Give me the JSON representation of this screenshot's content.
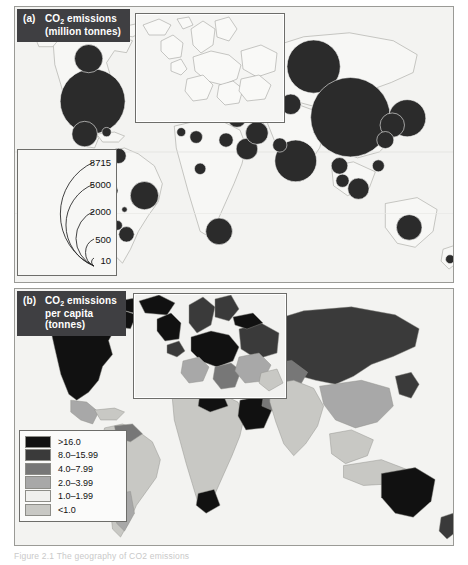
{
  "figure": {
    "caption": "Figure 2.1  The geography of CO2 emissions"
  },
  "colors": {
    "map_background": "#f3f3f1",
    "country_outline": "#8f8f8a",
    "bubble_fill": "#2b2b2b",
    "plate_background": "#3f3f42",
    "plate_text": "#ffffff",
    "class_over16": "#111111",
    "class_8_16": "#3a3a3a",
    "class_4_8": "#777777",
    "class_2_4": "#a8a8a8",
    "class_1_2": "#f0f0ee",
    "class_under1": "#c8c8c4"
  },
  "panel_a": {
    "id": "(a)",
    "title_line1": "CO",
    "title_sub": "2",
    "title_line1_rest": " emissions",
    "title_line2": "(million tonnes)",
    "legend": {
      "name": "bubble-size-legend",
      "unit": "million tonnes",
      "entries": [
        {
          "label": "8715",
          "value": 8715
        },
        {
          "label": "5000",
          "value": 5000
        },
        {
          "label": "2000",
          "value": 2000
        },
        {
          "label": "500",
          "value": 500
        },
        {
          "label": "10",
          "value": 10
        }
      ]
    },
    "inset": {
      "name": "europe-inset",
      "region": "Europe"
    }
  },
  "panel_b": {
    "id": "(b)",
    "title_line1": "CO",
    "title_sub": "2",
    "title_line1_rest": " emissions",
    "title_line2": "per capita",
    "title_line3": "(tonnes)",
    "legend": {
      "name": "per-capita-class-legend",
      "unit": "tonnes",
      "entries": [
        {
          "label": ">16.0",
          "color": "#111111"
        },
        {
          "label": "8.0–15.99",
          "color": "#3a3a3a"
        },
        {
          "label": "4.0–7.99",
          "color": "#777777"
        },
        {
          "label": "2.0–3.99",
          "color": "#a8a8a8"
        },
        {
          "label": "1.0–1.99",
          "color": "#f0f0ee"
        },
        {
          "label": "<1.0",
          "color": "#c8c8c4"
        }
      ]
    },
    "inset": {
      "name": "europe-inset",
      "region": "Europe"
    }
  },
  "chart_data": [
    {
      "type": "bubble-map",
      "title": "CO2 emissions (million tonnes)",
      "panel": "(a)",
      "unit": "million tonnes",
      "size_legend_values": [
        8715,
        5000,
        2000,
        500,
        10
      ],
      "max_value": 8715,
      "points": [
        {
          "name": "United States",
          "value": 5800,
          "x": 78,
          "y": 95
        },
        {
          "name": "Canada",
          "value": 1100,
          "x": 74,
          "y": 52
        },
        {
          "name": "Mexico",
          "value": 900,
          "x": 70,
          "y": 128
        },
        {
          "name": "Cuba",
          "value": 120,
          "x": 92,
          "y": 126
        },
        {
          "name": "Venezuela",
          "value": 320,
          "x": 104,
          "y": 150
        },
        {
          "name": "Colombia",
          "value": 210,
          "x": 94,
          "y": 160
        },
        {
          "name": "Brazil",
          "value": 1100,
          "x": 130,
          "y": 190
        },
        {
          "name": "Peru",
          "value": 110,
          "x": 99,
          "y": 185
        },
        {
          "name": "Chile",
          "value": 130,
          "x": 103,
          "y": 220
        },
        {
          "name": "Argentina",
          "value": 330,
          "x": 112,
          "y": 229
        },
        {
          "name": "Bolivia",
          "value": 40,
          "x": 110,
          "y": 204
        },
        {
          "name": "Morocco",
          "value": 110,
          "x": 167,
          "y": 126
        },
        {
          "name": "Algeria",
          "value": 220,
          "x": 182,
          "y": 131
        },
        {
          "name": "Egypt",
          "value": 280,
          "x": 212,
          "y": 134
        },
        {
          "name": "Nigeria",
          "value": 180,
          "x": 186,
          "y": 163
        },
        {
          "name": "South Africa",
          "value": 980,
          "x": 205,
          "y": 226
        },
        {
          "name": "Saudi Arabia",
          "value": 640,
          "x": 233,
          "y": 143
        },
        {
          "name": "Iran",
          "value": 700,
          "x": 243,
          "y": 127
        },
        {
          "name": "Turkey",
          "value": 460,
          "x": 223,
          "y": 112
        },
        {
          "name": "Russia",
          "value": 3900,
          "x": 300,
          "y": 60
        },
        {
          "name": "Kazakhstan",
          "value": 580,
          "x": 277,
          "y": 98
        },
        {
          "name": "India",
          "value": 2400,
          "x": 282,
          "y": 155
        },
        {
          "name": "Pakistan",
          "value": 280,
          "x": 266,
          "y": 139
        },
        {
          "name": "China",
          "value": 8715,
          "x": 337,
          "y": 111
        },
        {
          "name": "Japan",
          "value": 1900,
          "x": 394,
          "y": 112
        },
        {
          "name": "South Korea",
          "value": 820,
          "x": 379,
          "y": 119
        },
        {
          "name": "Taiwan",
          "value": 400,
          "x": 372,
          "y": 134
        },
        {
          "name": "Thailand",
          "value": 380,
          "x": 326,
          "y": 160
        },
        {
          "name": "Indonesia",
          "value": 620,
          "x": 345,
          "y": 183
        },
        {
          "name": "Malaysia",
          "value": 240,
          "x": 329,
          "y": 175
        },
        {
          "name": "Philippines",
          "value": 200,
          "x": 365,
          "y": 160
        },
        {
          "name": "Australia",
          "value": 900,
          "x": 396,
          "y": 222
        },
        {
          "name": "New Zealand",
          "value": 110,
          "x": 437,
          "y": 254
        }
      ],
      "inset_points": [
        {
          "name": "United Kingdom",
          "value": 1100,
          "x": 172,
          "y": 57
        },
        {
          "name": "Ireland",
          "value": 180,
          "x": 152,
          "y": 62
        },
        {
          "name": "France",
          "value": 900,
          "x": 180,
          "y": 77
        },
        {
          "name": "Spain",
          "value": 700,
          "x": 166,
          "y": 92
        },
        {
          "name": "Portugal",
          "value": 180,
          "x": 150,
          "y": 93
        },
        {
          "name": "Germany",
          "value": 1500,
          "x": 203,
          "y": 65
        },
        {
          "name": "Italy",
          "value": 900,
          "x": 205,
          "y": 94
        },
        {
          "name": "Poland",
          "value": 700,
          "x": 220,
          "y": 60
        },
        {
          "name": "Netherlands",
          "value": 400,
          "x": 192,
          "y": 52
        },
        {
          "name": "Belgium",
          "value": 300,
          "x": 186,
          "y": 63
        },
        {
          "name": "Norway",
          "value": 200,
          "x": 200,
          "y": 28
        },
        {
          "name": "Sweden",
          "value": 260,
          "x": 213,
          "y": 29
        },
        {
          "name": "Denmark",
          "value": 230,
          "x": 203,
          "y": 42
        },
        {
          "name": "Finland",
          "value": 240,
          "x": 232,
          "y": 26
        },
        {
          "name": "Czechia",
          "value": 320,
          "x": 214,
          "y": 72
        },
        {
          "name": "Austria",
          "value": 250,
          "x": 210,
          "y": 80
        },
        {
          "name": "Switzerland",
          "value": 180,
          "x": 195,
          "y": 82
        },
        {
          "name": "Hungary",
          "value": 200,
          "x": 226,
          "y": 80
        },
        {
          "name": "Romania",
          "value": 330,
          "x": 242,
          "y": 83
        },
        {
          "name": "Greece",
          "value": 290,
          "x": 228,
          "y": 103
        },
        {
          "name": "Ukraine",
          "value": 720,
          "x": 250,
          "y": 63
        },
        {
          "name": "Belarus",
          "value": 280,
          "x": 245,
          "y": 48
        },
        {
          "name": "Bulgaria",
          "value": 250,
          "x": 238,
          "y": 94
        },
        {
          "name": "Serbia",
          "value": 180,
          "x": 224,
          "y": 92
        }
      ]
    },
    {
      "type": "choropleth-map",
      "title": "CO2 emissions per capita (tonnes)",
      "panel": "(b)",
      "unit": "tonnes per capita",
      "classes": [
        {
          "label": ">16.0",
          "color": "#111111"
        },
        {
          "label": "8.0–15.99",
          "color": "#3a3a3a"
        },
        {
          "label": "4.0–7.99",
          "color": "#777777"
        },
        {
          "label": "2.0–3.99",
          "color": "#a8a8a8"
        },
        {
          "label": "1.0–1.99",
          "color": "#f0f0ee"
        },
        {
          "label": "<1.0",
          "color": "#c8c8c4"
        }
      ],
      "country_classes": [
        {
          "name": "United States",
          "class": ">16.0"
        },
        {
          "name": "Canada",
          "class": ">16.0"
        },
        {
          "name": "Mexico",
          "class": "2.0–3.99"
        },
        {
          "name": "Brazil",
          "class": "1.0–1.99"
        },
        {
          "name": "Argentina",
          "class": "2.0–3.99"
        },
        {
          "name": "Venezuela",
          "class": "4.0–7.99"
        },
        {
          "name": "Chile",
          "class": "2.0–3.99"
        },
        {
          "name": "Russia",
          "class": "8.0–15.99"
        },
        {
          "name": "China",
          "class": "2.0–3.99"
        },
        {
          "name": "India",
          "class": "<1.0"
        },
        {
          "name": "Japan",
          "class": "8.0–15.99"
        },
        {
          "name": "Australia",
          "class": ">16.0"
        },
        {
          "name": "New Zealand",
          "class": "8.0–15.99"
        },
        {
          "name": "Saudi Arabia",
          "class": ">16.0"
        },
        {
          "name": "Libya",
          "class": ">16.0"
        },
        {
          "name": "South Africa",
          "class": ">16.0"
        },
        {
          "name": "Nigeria",
          "class": "<1.0"
        },
        {
          "name": "Egypt",
          "class": "2.0–3.99"
        },
        {
          "name": "Germany",
          "class": ">16.0"
        },
        {
          "name": "United Kingdom",
          "class": ">16.0"
        },
        {
          "name": "France",
          "class": "8.0–15.99"
        },
        {
          "name": "Spain",
          "class": "4.0–7.99"
        },
        {
          "name": "Italy",
          "class": "4.0–7.99"
        },
        {
          "name": "Poland",
          "class": ">16.0"
        },
        {
          "name": "Ukraine",
          "class": "8.0–15.99"
        },
        {
          "name": "Scandinavia",
          "class": "8.0–15.99"
        }
      ]
    }
  ]
}
